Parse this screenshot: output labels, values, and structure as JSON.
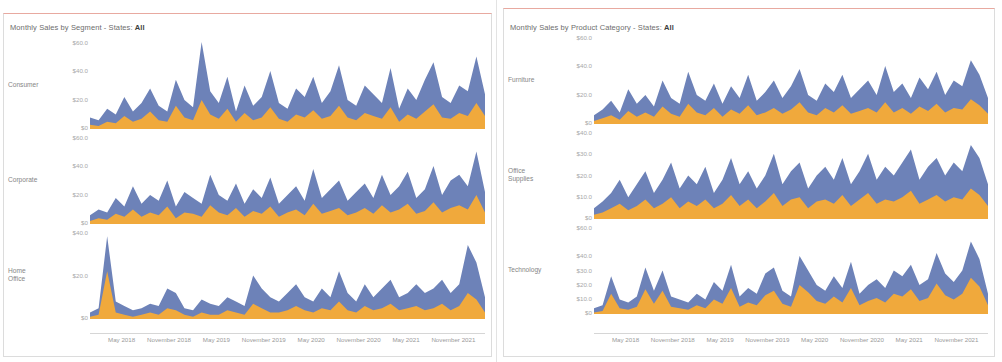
{
  "panels": [
    {
      "id": "segment",
      "title_prefix": "Monthly Sales by Segment - States:",
      "title_value": "All",
      "rows": [
        {
          "label": "Consumer",
          "ticks": [
            "$60.0",
            "$40.0",
            "$20.0",
            "$0",
            "$0.0"
          ]
        },
        {
          "label": "Corporate",
          "ticks": [
            "$60.0",
            "$40.0",
            "$20.0",
            "$0",
            "$0.0"
          ]
        },
        {
          "label": "Home\nOffice",
          "ticks": [
            "$40.0",
            "$20.0",
            "$0"
          ]
        }
      ],
      "xticks": [
        "May 2018",
        "November 2018",
        "May 2019",
        "November 2019",
        "May 2020",
        "November 2020",
        "May 2021",
        "November 2021"
      ]
    },
    {
      "id": "category",
      "title_prefix": "Monthly Sales by Product Category - States:",
      "title_value": "All",
      "rows": [
        {
          "label": "Furniture",
          "ticks": [
            "$60.0",
            "$40.0",
            "$20.0",
            "$0",
            "$0.0"
          ]
        },
        {
          "label": "Office\nSupplies",
          "ticks": [
            "$40.0",
            "$30.0",
            "$20.0",
            "$10.0",
            "$0",
            "$0.0"
          ]
        },
        {
          "label": "Technology",
          "ticks": [
            "$60.0",
            "$40.0",
            "$30.0",
            "$20.0",
            "$10.0",
            "$0"
          ]
        }
      ],
      "xticks": [
        "May 2018",
        "November 2018",
        "May 2019",
        "November 2019",
        "May 2020",
        "November 2020",
        "May 2021",
        "November 2021"
      ]
    }
  ],
  "colors": {
    "series_upper": "#6d82b8",
    "series_lower": "#f0a93c",
    "sheet_rule": "#e8a9a0",
    "axis_text": "#a8a8a8",
    "title_text": "#6d6d6d"
  },
  "chart_data": {
    "type": "area",
    "xlabel": "",
    "ylabel": "Sales",
    "grid": false,
    "legend": "none",
    "x_start": "2018-02",
    "x_end": "2021-12",
    "x_ticks": [
      "May 2018",
      "November 2018",
      "May 2019",
      "November 2019",
      "May 2020",
      "November 2020",
      "May 2021",
      "November 2021"
    ],
    "panels": [
      {
        "name": "Monthly Sales by Segment",
        "charts": [
          {
            "row": "Consumer",
            "ylim": [
              0,
              60
            ],
            "yticks": [
              0,
              20,
              40,
              60
            ],
            "series": [
              {
                "name": "upper-blue",
                "color": "#6d82b8",
                "values": [
                  8,
                  6,
                  14,
                  10,
                  22,
                  12,
                  18,
                  28,
                  16,
                  12,
                  34,
                  20,
                  15,
                  60,
                  26,
                  18,
                  36,
                  12,
                  30,
                  16,
                  22,
                  40,
                  18,
                  14,
                  28,
                  22,
                  36,
                  18,
                  26,
                  44,
                  20,
                  16,
                  30,
                  24,
                  18,
                  42,
                  14,
                  28,
                  20,
                  34,
                  46,
                  22,
                  18,
                  30,
                  26,
                  50,
                  24
                ]
              },
              {
                "name": "lower-orange",
                "color": "#f0a93c",
                "values": [
                  3,
                  2,
                  5,
                  4,
                  9,
                  5,
                  7,
                  12,
                  6,
                  5,
                  16,
                  8,
                  6,
                  20,
                  10,
                  7,
                  14,
                  5,
                  11,
                  6,
                  8,
                  15,
                  7,
                  5,
                  10,
                  8,
                  13,
                  7,
                  9,
                  16,
                  8,
                  6,
                  11,
                  9,
                  7,
                  15,
                  5,
                  10,
                  7,
                  12,
                  17,
                  8,
                  7,
                  11,
                  9,
                  18,
                  9
                ]
              }
            ]
          },
          {
            "row": "Corporate",
            "ylim": [
              0,
              60
            ],
            "yticks": [
              0,
              20,
              40,
              60
            ],
            "series": [
              {
                "name": "upper-blue",
                "color": "#6d82b8",
                "values": [
                  6,
                  10,
                  8,
                  18,
                  12,
                  26,
                  14,
                  20,
                  16,
                  30,
                  12,
                  22,
                  18,
                  14,
                  34,
                  20,
                  16,
                  28,
                  14,
                  24,
                  18,
                  32,
                  14,
                  20,
                  26,
                  16,
                  38,
                  18,
                  24,
                  30,
                  16,
                  22,
                  28,
                  18,
                  34,
                  20,
                  26,
                  36,
                  18,
                  24,
                  40,
                  20,
                  30,
                  34,
                  26,
                  50,
                  22
                ]
              },
              {
                "name": "lower-orange",
                "color": "#f0a93c",
                "values": [
                  2,
                  4,
                  3,
                  7,
                  5,
                  10,
                  5,
                  8,
                  6,
                  12,
                  4,
                  8,
                  7,
                  5,
                  13,
                  8,
                  6,
                  11,
                  5,
                  9,
                  7,
                  12,
                  5,
                  8,
                  10,
                  6,
                  14,
                  7,
                  9,
                  11,
                  6,
                  8,
                  11,
                  7,
                  13,
                  8,
                  10,
                  14,
                  7,
                  9,
                  15,
                  8,
                  11,
                  13,
                  10,
                  20,
                  8
                ]
              }
            ]
          },
          {
            "row": "Home Office",
            "ylim": [
              0,
              40
            ],
            "yticks": [
              0,
              20,
              40
            ],
            "series": [
              {
                "name": "upper-blue",
                "color": "#6d82b8",
                "values": [
                  3,
                  5,
                  38,
                  8,
                  6,
                  4,
                  5,
                  7,
                  6,
                  14,
                  12,
                  5,
                  4,
                  9,
                  7,
                  6,
                  10,
                  8,
                  6,
                  20,
                  14,
                  10,
                  8,
                  12,
                  16,
                  10,
                  8,
                  14,
                  10,
                  22,
                  12,
                  8,
                  16,
                  10,
                  14,
                  18,
                  10,
                  12,
                  16,
                  12,
                  14,
                  18,
                  12,
                  16,
                  34,
                  26,
                  10
                ]
              },
              {
                "name": "lower-orange",
                "color": "#f0a93c",
                "values": [
                  1,
                  2,
                  22,
                  3,
                  2,
                  1,
                  2,
                  3,
                  2,
                  5,
                  4,
                  2,
                  1,
                  3,
                  2,
                  2,
                  4,
                  3,
                  2,
                  7,
                  5,
                  3,
                  3,
                  4,
                  6,
                  4,
                  3,
                  5,
                  4,
                  8,
                  4,
                  3,
                  6,
                  4,
                  5,
                  7,
                  4,
                  5,
                  6,
                  4,
                  5,
                  7,
                  4,
                  6,
                  12,
                  9,
                  3
                ]
              }
            ]
          }
        ]
      },
      {
        "name": "Monthly Sales by Product Category",
        "charts": [
          {
            "row": "Furniture",
            "ylim": [
              0,
              60
            ],
            "yticks": [
              0,
              20,
              40,
              60
            ],
            "series": [
              {
                "name": "upper-blue",
                "color": "#6d82b8",
                "values": [
                  6,
                  10,
                  16,
                  8,
                  24,
                  14,
                  20,
                  12,
                  30,
                  18,
                  14,
                  36,
                  20,
                  16,
                  28,
                  14,
                  26,
                  18,
                  34,
                  16,
                  22,
                  30,
                  18,
                  26,
                  38,
                  20,
                  16,
                  28,
                  22,
                  34,
                  18,
                  24,
                  30,
                  20,
                  40,
                  22,
                  28,
                  18,
                  32,
                  24,
                  36,
                  20,
                  30,
                  26,
                  44,
                  34,
                  18
                ]
              },
              {
                "name": "lower-orange",
                "color": "#f0a93c",
                "values": [
                  2,
                  4,
                  6,
                  3,
                  9,
                  5,
                  8,
                  5,
                  12,
                  7,
                  5,
                  14,
                  8,
                  6,
                  11,
                  5,
                  10,
                  7,
                  13,
                  6,
                  8,
                  11,
                  7,
                  10,
                  15,
                  8,
                  6,
                  11,
                  8,
                  13,
                  7,
                  9,
                  11,
                  8,
                  15,
                  8,
                  11,
                  7,
                  12,
                  9,
                  14,
                  8,
                  11,
                  10,
                  17,
                  13,
                  7
                ]
              }
            ]
          },
          {
            "row": "Office Supplies",
            "ylim": [
              0,
              40
            ],
            "yticks": [
              0,
              10,
              20,
              30,
              40
            ],
            "series": [
              {
                "name": "upper-blue",
                "color": "#6d82b8",
                "values": [
                  5,
                  8,
                  12,
                  18,
                  10,
                  16,
                  22,
                  12,
                  18,
                  26,
                  14,
                  20,
                  16,
                  24,
                  12,
                  18,
                  28,
                  16,
                  22,
                  14,
                  20,
                  30,
                  16,
                  22,
                  26,
                  14,
                  20,
                  24,
                  18,
                  28,
                  16,
                  22,
                  30,
                  18,
                  24,
                  20,
                  26,
                  32,
                  18,
                  24,
                  28,
                  20,
                  26,
                  22,
                  34,
                  28,
                  16
                ]
              },
              {
                "name": "lower-orange",
                "color": "#f0a93c",
                "values": [
                  2,
                  3,
                  5,
                  7,
                  4,
                  6,
                  9,
                  5,
                  7,
                  10,
                  5,
                  8,
                  6,
                  9,
                  5,
                  7,
                  11,
                  6,
                  9,
                  5,
                  8,
                  12,
                  6,
                  9,
                  10,
                  5,
                  8,
                  9,
                  7,
                  11,
                  6,
                  9,
                  12,
                  7,
                  9,
                  8,
                  10,
                  13,
                  7,
                  9,
                  11,
                  8,
                  10,
                  9,
                  14,
                  11,
                  6
                ]
              }
            ]
          },
          {
            "row": "Technology",
            "ylim": [
              0,
              60
            ],
            "yticks": [
              0,
              10,
              20,
              30,
              40,
              60
            ],
            "series": [
              {
                "name": "upper-blue",
                "color": "#6d82b8",
                "values": [
                  4,
                  6,
                  26,
                  10,
                  8,
                  12,
                  32,
                  16,
                  30,
                  12,
                  10,
                  8,
                  14,
                  10,
                  22,
                  16,
                  34,
                  12,
                  18,
                  14,
                  28,
                  32,
                  16,
                  12,
                  40,
                  30,
                  20,
                  16,
                  26,
                  18,
                  36,
                  14,
                  20,
                  24,
                  18,
                  30,
                  26,
                  34,
                  20,
                  24,
                  42,
                  28,
                  22,
                  30,
                  50,
                  38,
                  14
                ]
              },
              {
                "name": "lower-orange",
                "color": "#f0a93c",
                "values": [
                  1,
                  2,
                  14,
                  4,
                  3,
                  5,
                  17,
                  7,
                  16,
                  5,
                  4,
                  3,
                  6,
                  4,
                  10,
                  7,
                  18,
                  5,
                  8,
                  6,
                  13,
                  16,
                  7,
                  5,
                  20,
                  15,
                  9,
                  7,
                  12,
                  8,
                  18,
                  6,
                  9,
                  11,
                  8,
                  14,
                  12,
                  17,
                  9,
                  11,
                  21,
                  13,
                  10,
                  14,
                  25,
                  19,
                  6
                ]
              }
            ]
          }
        ]
      }
    ]
  }
}
